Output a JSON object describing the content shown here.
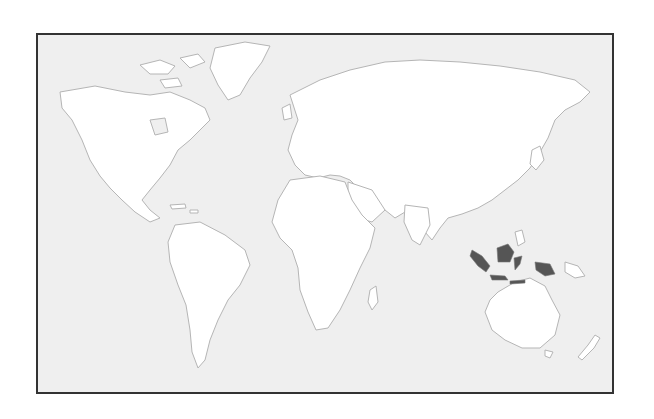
{
  "map": {
    "title": "",
    "projection": "world map",
    "highlighted_region": "Indonesia",
    "colors": {
      "ocean": "#efefef",
      "land": "#ffffff",
      "coastline": "#b5b5b5",
      "highlight": "#555555",
      "frame": "#333333"
    }
  }
}
